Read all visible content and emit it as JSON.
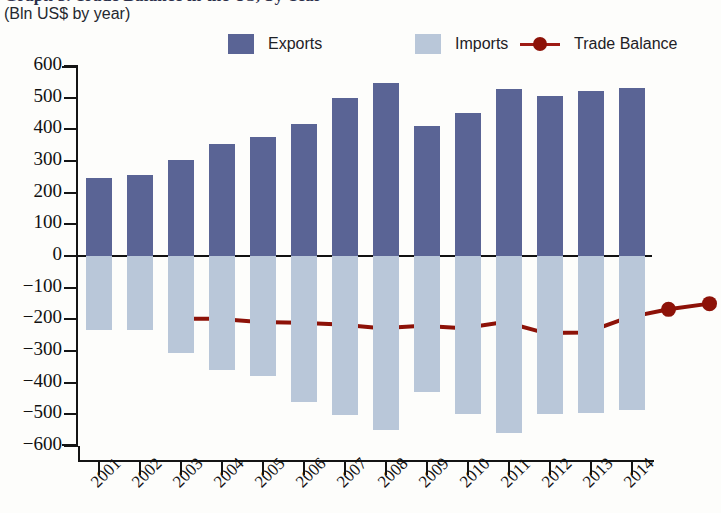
{
  "header": {
    "title": "Graph 3. Trade Balance in the US, by Year",
    "subtitle": "(Bln US$ by year)"
  },
  "legend": {
    "position": "top",
    "items": [
      {
        "label": "Exports",
        "type": "swatch",
        "color": "#5a6495",
        "icon": "square-swatch"
      },
      {
        "label": "Imports",
        "type": "swatch",
        "color": "#b9c7d9",
        "icon": "square-swatch"
      },
      {
        "label": "Trade Balance",
        "type": "line-marker",
        "color": "#8d1208",
        "icon": "line-with-dot-marker"
      }
    ]
  },
  "axes": {
    "y": {
      "ticks": [
        "600",
        "500",
        "400",
        "300",
        "200",
        "100",
        "0",
        "−100",
        "−200",
        "−300",
        "−400",
        "−500",
        "−600"
      ],
      "min": -600,
      "max": 600,
      "step": 100
    },
    "x": {
      "ticks": [
        "2001",
        "2002",
        "2003",
        "2004",
        "2005",
        "2006",
        "2007",
        "2008",
        "2009",
        "2010",
        "2011",
        "2012",
        "2013",
        "2014"
      ]
    }
  },
  "chart_data": {
    "type": "bar",
    "title": "Graph 3. Trade Balance in the US, by Year",
    "subtitle": "(Bln US$ by year)",
    "xlabel": "",
    "ylabel": "Bln US$ by year",
    "ylim": [
      -600,
      600
    ],
    "ytick_step": 100,
    "grid": false,
    "legend_position": "top",
    "categories": [
      "2001",
      "2002",
      "2003",
      "2004",
      "2005",
      "2006",
      "2007",
      "2008",
      "2009",
      "2010",
      "2011",
      "2012",
      "2013",
      "2014"
    ],
    "series": [
      {
        "name": "Exports",
        "type": "bar",
        "color": "#5a6495",
        "values": [
          246,
          255,
          303,
          353,
          375,
          418,
          500,
          547,
          409,
          452,
          528,
          505,
          520,
          530
        ]
      },
      {
        "name": "Imports",
        "type": "bar",
        "color": "#b9c7d9",
        "values": [
          -233,
          -233,
          -306,
          -361,
          -378,
          -462,
          -502,
          -549,
          -430,
          -498,
          -558,
          -500,
          -495,
          -487
        ]
      },
      {
        "name": "Trade Balance",
        "type": "line",
        "color": "#8d1208",
        "values": [
          10,
          10,
          0,
          -2,
          -8,
          -20,
          -12,
          -20,
          0,
          -35,
          -33,
          14,
          40,
          58
        ]
      }
    ]
  }
}
